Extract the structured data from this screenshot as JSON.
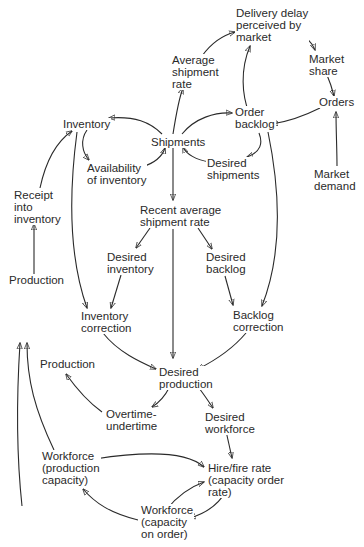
{
  "diagram": {
    "type": "causal-loop",
    "nodes": {
      "delivery_delay": "Delivery delay\nperceived by\nmarket",
      "average_shipment_rate": "Average\nshipment\nrate",
      "market_share": "Market\nshare",
      "orders": "Orders",
      "order_backlog": "Order\nbacklog",
      "inventory": "Inventory",
      "shipments": "Shipments",
      "availability_of_inventory": "Availability\nof inventory",
      "desired_shipments": "Desired\nshipments",
      "market_demand": "Market\ndemand",
      "receipt_into_inventory": "Receipt\ninto\ninventory",
      "recent_average_shipment_rate": "Recent average\nshipment rate",
      "desired_inventory": "Desired\ninventory",
      "desired_backlog": "Desired\nbacklog",
      "production_top": "Production",
      "inventory_correction": "Inventory\ncorrection",
      "backlog_correction": "Backlog\ncorrection",
      "production_mid": "Production",
      "desired_production": "Desired\nproduction",
      "overtime_undertime": "Overtime-\nundertime",
      "desired_workforce": "Desired\nworkforce",
      "workforce_production_capacity": "Workforce\n(production\ncapacity)",
      "hire_fire_rate": "Hire/fire rate\n(capacity order\nrate)",
      "workforce_capacity_on_order": "Workforce\n(capacity\non order)"
    },
    "edges": [
      [
        "shipments",
        "average_shipment_rate"
      ],
      [
        "average_shipment_rate",
        "delivery_delay"
      ],
      [
        "order_backlog",
        "delivery_delay"
      ],
      [
        "delivery_delay",
        "market_share"
      ],
      [
        "market_share",
        "orders"
      ],
      [
        "market_demand",
        "orders"
      ],
      [
        "orders",
        "order_backlog"
      ],
      [
        "shipments",
        "inventory"
      ],
      [
        "shipments",
        "order_backlog"
      ],
      [
        "inventory",
        "availability_of_inventory"
      ],
      [
        "availability_of_inventory",
        "shipments"
      ],
      [
        "order_backlog",
        "desired_shipments"
      ],
      [
        "desired_shipments",
        "shipments"
      ],
      [
        "shipments",
        "recent_average_shipment_rate"
      ],
      [
        "receipt_into_inventory",
        "inventory"
      ],
      [
        "production_top",
        "receipt_into_inventory"
      ],
      [
        "recent_average_shipment_rate",
        "desired_inventory"
      ],
      [
        "recent_average_shipment_rate",
        "desired_backlog"
      ],
      [
        "recent_average_shipment_rate",
        "desired_production"
      ],
      [
        "inventory",
        "inventory_correction"
      ],
      [
        "desired_inventory",
        "inventory_correction"
      ],
      [
        "desired_backlog",
        "backlog_correction"
      ],
      [
        "order_backlog",
        "backlog_correction"
      ],
      [
        "inventory_correction",
        "desired_production"
      ],
      [
        "backlog_correction",
        "desired_production"
      ],
      [
        "desired_production",
        "overtime_undertime"
      ],
      [
        "overtime_undertime",
        "production_top"
      ],
      [
        "desired_production",
        "desired_workforce"
      ],
      [
        "desired_workforce",
        "hire_fire_rate"
      ],
      [
        "workforce_production_capacity",
        "hire_fire_rate"
      ],
      [
        "workforce_production_capacity",
        "production_top"
      ],
      [
        "hire_fire_rate",
        "workforce_capacity_on_order"
      ],
      [
        "workforce_capacity_on_order",
        "hire_fire_rate"
      ],
      [
        "workforce_capacity_on_order",
        "workforce_production_capacity"
      ]
    ]
  }
}
